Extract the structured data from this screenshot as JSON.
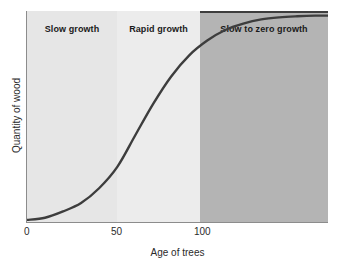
{
  "chart_data": {
    "type": "line",
    "title": "",
    "xlabel": "Age of trees",
    "ylabel": "Quantity of wood",
    "xlim": [
      0,
      167
    ],
    "ylim": [
      0,
      1
    ],
    "xticks": [
      0,
      50,
      100
    ],
    "xtick_labels": [
      "0",
      "50",
      "100"
    ],
    "yticks": [],
    "ytick_labels": [],
    "grid": false,
    "legend": "none",
    "series": [
      {
        "name": "Quantity of wood",
        "description": "Sigmoidal growth curve of wood quantity against tree age",
        "x": [
          0,
          10,
          20,
          30,
          40,
          50,
          60,
          70,
          80,
          90,
          100,
          110,
          120,
          130,
          140,
          150,
          160,
          167
        ],
        "y": [
          0.01,
          0.02,
          0.05,
          0.09,
          0.16,
          0.26,
          0.41,
          0.56,
          0.69,
          0.79,
          0.86,
          0.91,
          0.94,
          0.96,
          0.97,
          0.975,
          0.978,
          0.978
        ]
      }
    ],
    "bands": [
      {
        "label": "Slow growth",
        "x_start": 0,
        "x_end": 50,
        "color": "#e6e6e6"
      },
      {
        "label": "Rapid growth",
        "x_start": 50,
        "x_end": 96,
        "color": "#ececec"
      },
      {
        "label": "Slow to zero growth",
        "x_start": 96,
        "x_end": 167,
        "color": "#b4b4b4"
      }
    ],
    "annotations": [
      "Slow growth",
      "Rapid growth",
      "Slow to zero growth"
    ],
    "curve_color": "#3d3d3d",
    "axis_color": "#8c8c8c",
    "background": "#ffffff"
  },
  "axes": {
    "x_title": "Age of trees",
    "y_title": "Quantity of wood",
    "x_tick_0": "0",
    "x_tick_50": "50",
    "x_tick_100": "100"
  },
  "bands": {
    "slow": "Slow growth",
    "rapid": "Rapid growth",
    "zero": "Slow to zero growth"
  }
}
